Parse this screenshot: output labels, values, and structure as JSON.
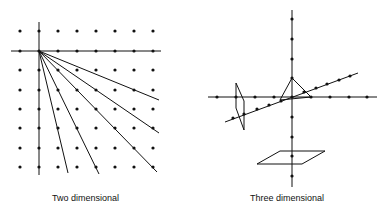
{
  "figures": [
    {
      "id": "two-dimensional",
      "caption": "Two dimensional"
    },
    {
      "id": "three-dimensional",
      "caption": "Three dimensional"
    }
  ],
  "colors": {
    "ink": "#111111",
    "background": "#ffffff"
  }
}
